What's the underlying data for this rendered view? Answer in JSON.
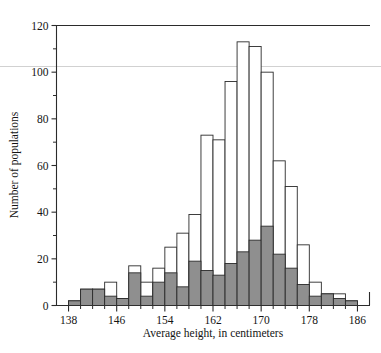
{
  "chart_data": {
    "type": "bar",
    "title": "",
    "subtitle": "",
    "xlabel": "Average height, in centimeters",
    "ylabel": "Number of populations",
    "xlim": [
      136,
      188
    ],
    "ylim": [
      0,
      120
    ],
    "bin_width": 2,
    "grid": false,
    "legend": null,
    "x_tick_labels": [
      "138",
      "146",
      "154",
      "162",
      "170",
      "178",
      "186"
    ],
    "x_tick_values": [
      138,
      146,
      154,
      162,
      170,
      178,
      186
    ],
    "x_minor_tick_values": [
      140,
      142,
      144,
      148,
      150,
      152,
      156,
      158,
      160,
      164,
      166,
      168,
      172,
      174,
      176,
      180,
      182,
      184
    ],
    "y_tick_labels": [
      "0",
      "20",
      "40",
      "60",
      "80",
      "100",
      "120"
    ],
    "y_tick_values": [
      0,
      20,
      40,
      60,
      80,
      100,
      120
    ],
    "y_minor_tick_values": [
      10,
      30,
      50,
      70,
      90,
      110
    ],
    "categories": [
      138,
      140,
      142,
      144,
      146,
      148,
      150,
      152,
      154,
      156,
      158,
      160,
      162,
      164,
      166,
      168,
      170,
      172,
      174,
      176,
      178,
      180,
      182,
      184
    ],
    "series": [
      {
        "name": "Total populations",
        "style": "open",
        "fill_color": "#ffffff",
        "edge_color": "#2b2b2b",
        "values": [
          2,
          7,
          7,
          10,
          3,
          17,
          10,
          16,
          25,
          31,
          39,
          73,
          71,
          96,
          113,
          111,
          100,
          62,
          51,
          26,
          10,
          5,
          5,
          2
        ]
      },
      {
        "name": "Shaded subset",
        "style": "filled",
        "fill_color": "#8f8f8f",
        "edge_color": "#2b2b2b",
        "values": [
          2,
          7,
          7,
          4,
          3,
          14,
          4,
          10,
          14,
          8,
          19,
          15,
          13,
          18,
          23,
          28,
          34,
          22,
          16,
          9,
          4,
          5,
          3,
          2
        ]
      }
    ]
  },
  "axes": {
    "x_title": "Average height, in centimeters",
    "y_title": "Number of populations"
  }
}
